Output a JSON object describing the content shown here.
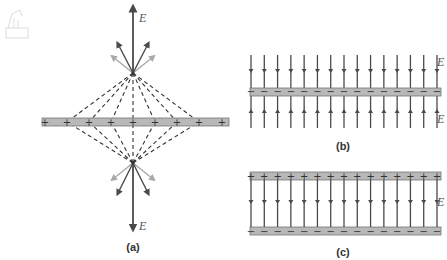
{
  "figure": {
    "panels": [
      {
        "id": "a",
        "label": "(a)",
        "description": "Field of an infinite charged sheet built from point charge contributions",
        "field_labels": [
          "E",
          "E"
        ],
        "sheet_charge_sign": "+",
        "sheet_charge_count": 9
      },
      {
        "id": "b",
        "label": "(b)",
        "description": "Field lines pointing into a negatively charged sheet from both sides",
        "field_labels": [
          "E",
          "E"
        ],
        "sheet_charge_sign": "−",
        "field_line_count": 15
      },
      {
        "id": "c",
        "label": "(c)",
        "description": "Uniform field between a positive (top) and negative (bottom) parallel plate",
        "field_labels": [
          "E"
        ],
        "top_plate_sign": "+",
        "bottom_plate_sign": "−",
        "field_line_count": 15
      }
    ],
    "colors": {
      "arrow": "#4a4a4a",
      "arrow_light": "#a8a8a8",
      "plate": "#b8b8b8",
      "plate_border": "#777777",
      "dash": "#333333"
    }
  }
}
